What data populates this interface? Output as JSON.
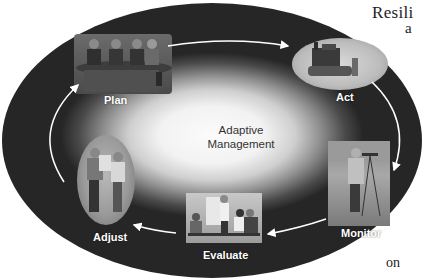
{
  "figure": {
    "center_label_line1": "Adaptive",
    "center_label_line2": "Management",
    "stages": [
      {
        "label": "Plan",
        "icon": "meeting-table-people"
      },
      {
        "label": "Act",
        "icon": "bulldozer"
      },
      {
        "label": "Monitor",
        "icon": "surveyor-with-tripod"
      },
      {
        "label": "Evaluate",
        "icon": "presentation-meeting"
      },
      {
        "label": "Adjust",
        "icon": "two-workers-reviewing-plans"
      }
    ],
    "cycle_direction": "clockwise",
    "colors": {
      "center": "#f5f5f5",
      "edge": "#262626",
      "label_text": "#ffffff",
      "arrow": "#ffffff"
    }
  },
  "surrounding_text": {
    "top_right_fragment": "Resili",
    "top_right_fragment_2": "a",
    "bottom_right_fragment": "on"
  }
}
